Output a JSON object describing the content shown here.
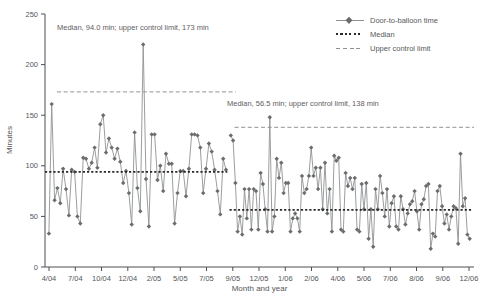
{
  "figure": {
    "y_axis": {
      "label": "Minutes"
    },
    "x_axis": {
      "label": "Month and year"
    },
    "legend": {
      "position": "top-right",
      "items": [
        {
          "label": "Door-to-balloon time",
          "style": "solid-line-with-diamond-marker"
        },
        {
          "label": "Median",
          "style": "bold-dotted-line"
        },
        {
          "label": "Upper control limit",
          "style": "dashed-line"
        }
      ]
    },
    "annotations": {
      "phase1": "Median, 94.0 min; upper control limit, 173 min",
      "phase2": "Median, 56.5 min; upper control limit, 138 min"
    }
  },
  "chart_data": {
    "type": "line",
    "title": "",
    "xlabel": "Month and year",
    "ylabel": "Minutes",
    "ylim": [
      0,
      250
    ],
    "grid": false,
    "legend_position": "top-right",
    "y_ticks": [
      0,
      50,
      100,
      150,
      200,
      250
    ],
    "x_tick_labels": [
      "4/04",
      "7/04",
      "10/04",
      "12/04",
      "2/05",
      "5/05",
      "7/05",
      "9/05",
      "12/05",
      "1/06",
      "2/06",
      "4/06",
      "5/06",
      "7/06",
      "8/06",
      "9/06",
      "12/06"
    ],
    "series_name": "Door-to-balloon time",
    "phases": [
      {
        "name": "phase-1 (4/04 to 8/05)",
        "median": 94.0,
        "upper_control_limit": 173,
        "x_frac": [
          0.009,
          0.422
        ],
        "median_x_frac": [
          0.0,
          0.425
        ],
        "ucl_x_frac": [
          0.028,
          0.445
        ],
        "values": [
          33,
          161,
          66,
          78,
          63,
          97,
          77,
          51,
          96,
          94,
          50,
          43,
          108,
          107,
          97,
          103,
          118,
          98,
          141,
          150,
          113,
          127,
          118,
          107,
          117,
          104,
          83,
          95,
          73,
          42,
          133,
          78,
          55,
          220,
          87,
          40,
          131,
          131,
          86,
          100,
          75,
          112,
          102,
          102,
          43,
          73,
          95,
          95,
          70,
          97,
          131,
          131,
          130,
          118,
          73,
          97,
          122,
          114,
          96,
          75,
          52,
          107,
          96
        ]
      },
      {
        "name": "phase-2 (9/05 to 12/06)",
        "median": 56.5,
        "upper_control_limit": 138,
        "x_frac": [
          0.433,
          0.99
        ],
        "median_x_frac": [
          0.43,
          0.995
        ],
        "ucl_x_frac": [
          0.442,
          1.0
        ],
        "values": [
          130,
          125,
          83,
          35,
          50,
          32,
          77,
          48,
          77,
          37,
          77,
          75,
          37,
          93,
          82,
          57,
          35,
          148,
          35,
          50,
          107,
          88,
          103,
          73,
          83,
          83,
          35,
          48,
          53,
          48,
          35,
          90,
          73,
          77,
          90,
          118,
          90,
          98,
          77,
          98,
          57,
          103,
          53,
          77,
          35,
          110,
          105,
          108,
          37,
          35,
          93,
          80,
          88,
          77,
          88,
          37,
          35,
          82,
          57,
          83,
          28,
          57,
          20,
          77,
          57,
          90,
          73,
          50,
          77,
          40,
          63,
          70,
          40,
          37,
          70,
          57,
          42,
          53,
          62,
          65,
          75,
          55,
          37,
          62,
          67,
          80,
          82,
          18,
          33,
          30,
          75,
          80,
          60,
          43,
          52,
          37,
          50,
          60,
          58,
          23,
          112,
          60,
          68,
          32,
          28
        ]
      }
    ],
    "colors": {
      "series": "#909294",
      "marker": "#6a6c6e",
      "median": "#2a2a2a",
      "ucl": "#8f9193",
      "axis": "#4d4e50",
      "text": "#55565a"
    }
  }
}
